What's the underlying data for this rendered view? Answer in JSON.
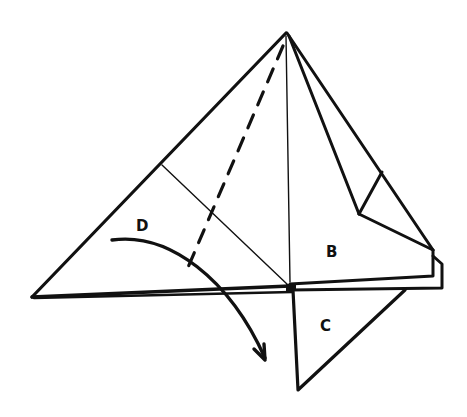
{
  "diagram": {
    "type": "origami-fold-instruction",
    "labels": {
      "d": "D",
      "b": "B",
      "c": "C"
    },
    "colors": {
      "stroke": "#111111",
      "background": "#ffffff"
    },
    "lines": {
      "dashed_fold": "valley-fold",
      "thin_creases": [
        "diagonal-crease",
        "vertical-crease"
      ]
    },
    "arrow": {
      "meaning": "fold-down"
    }
  }
}
